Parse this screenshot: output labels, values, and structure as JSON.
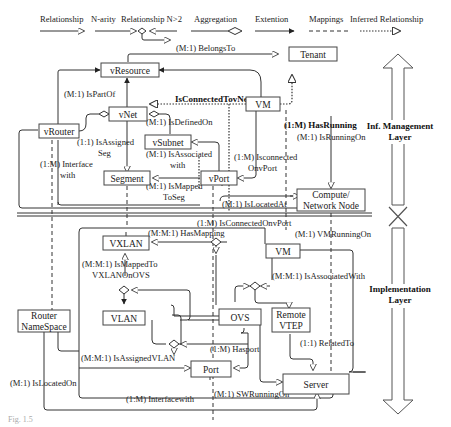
{
  "legend": {
    "items": [
      {
        "label": "Relationship",
        "style": "solid-arrow"
      },
      {
        "label": "N-arity",
        "style": "n-arity"
      },
      {
        "label": "Relationship N>2",
        "style": "n-arity"
      },
      {
        "label": "Aggregation",
        "style": "diamond"
      },
      {
        "label": "Extention",
        "style": "filled-arrow"
      },
      {
        "label": "Mappings",
        "style": "dashed"
      },
      {
        "label": "Inferred Relationship",
        "style": "dotted-arrow"
      }
    ]
  },
  "layers": {
    "top": "Inf. Management",
    "top2": "Layer",
    "bottom": "Implementation",
    "bottom2": "Layer"
  },
  "entities": {
    "vResource": "vResource",
    "tenant": "Tenant",
    "vNet": "vNet",
    "vm_top": "VM",
    "vRouter": "vRouter",
    "vSubnet": "vSubnet",
    "segment": "Segment",
    "vPort": "vPort",
    "compute1": "Compute/",
    "compute2": "Network Node",
    "vxlan": "VXLAN",
    "vm_bottom": "VM",
    "vlan": "VLAN",
    "ovs": "OVS",
    "remote1": "Remote",
    "remote2": "VTEP",
    "router1": "Router",
    "router2": "NameSpace",
    "port": "Port",
    "server": "Server"
  },
  "relations": {
    "belongsTo": "(M:1) BelongsTo",
    "isPartOf": "(M:1) IsPartOf",
    "isConnectedTovNet": "IsConnectedTovNet",
    "isDefinedOn": "(M:1) IsDefinedOn",
    "hasRunning": "(1:M) HasRunning",
    "isRunningOn": "(M:1) IsRunningOn",
    "isAssignedSeg1": "(1:1) IsAssigned",
    "isAssignedSeg2": "Seg",
    "isAssociatedWith1": "(M:1) IsAssociated",
    "isAssociatedWith2": "with",
    "isConnectedOnvPort1": "(1:M) Isconnected",
    "isConnectedOnvPort2": "OnvPort",
    "interfaceWith1": "(1:M) Interface",
    "interfaceWith2": "with",
    "isMappedToSeg1": "(M:1) IsMapped",
    "isMappedToSeg2": "ToSeg",
    "isLocatedAt": "(M:1) IsLocatedAt",
    "isConnectedOnvPortLow": "(1:M) IsConnectedOnvPort",
    "hasMapping": "(M:M:1) HasMapping",
    "vmRunningOn": "(M:1) VMRunningOn",
    "isMappedToVXLAN1": "(M:M:1) IsMappedTo",
    "isMappedToVXLAN2": "VXLANOnOVS",
    "isAssociatedWithLow": "(M:M:1) IsAssociatedWith",
    "relatedTo": "(1:1) RelatedTo",
    "hasport": "(1:M) Hasport",
    "isAssignedVLAN": "(M:M:1) IsAssignedVLAN",
    "isLocatedOn": "(M:1) IsLocatedOn",
    "swRunningOn": "(M:1) SWRunningOn",
    "interfacewith": "(1:M) Interfacewith"
  },
  "caption": "Fig. 1.5"
}
